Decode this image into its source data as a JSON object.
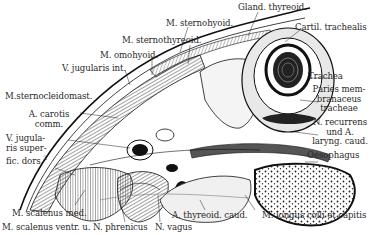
{
  "figure": {
    "labels": {
      "gland_thyreoid": "Gland. thyreoid.",
      "m_sternohyoid": "M. sternohyoid.",
      "cartil_trachealis": "Cartil. trachealis",
      "m_sternothyreoid": "M. sternothyreoid.",
      "m_omohyoid": "M. omohyoid.",
      "v_jugularis_int": "V. jugularis int.",
      "trachea": "Trachea",
      "m_sternocleidomast": "M.sternocleidomast.",
      "paries_1": "Paries mem-",
      "paries_2": "branaceus",
      "paries_3": "tracheae",
      "a_carotis_1": "A. carotis",
      "a_carotis_2": "comm.",
      "n_recurrens_1": "N. recurrens",
      "n_recurrens_2": "und A.",
      "n_recurrens_3": "laryng. caud.",
      "v_jug_sup_1": "V. jugula-",
      "v_jug_sup_2": "ris super-",
      "v_jug_sup_3": "fic. dors.",
      "v_jug_sup_sup": "2",
      "oesophagus": "Oesophagus",
      "m_scalenus_med": "M. scalenus med.",
      "a_thyreoid_caud": "A. thyreoid. caud.",
      "m_longus": "M. longus colli et capitis",
      "m_scalenus_ventr": "M. scalenus ventr. u. N. phrenicus",
      "n_vagus": "N. vagus"
    },
    "colors": {
      "ink": "#1a1a1a",
      "hatch": "#555555",
      "paper": "#ffffff",
      "shade": "#bdbdbd"
    }
  }
}
